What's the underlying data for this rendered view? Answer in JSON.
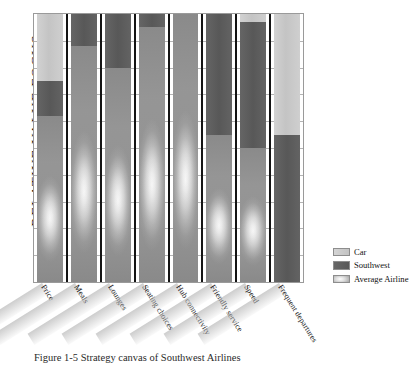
{
  "chart_data": {
    "type": "bar",
    "title": "",
    "subtitle": "",
    "xlabel": "",
    "ylabel": "RELATIVE VALUE FOCUS",
    "ylim": [
      0,
      100
    ],
    "grid": true,
    "gridlines": 10,
    "legend_position": "right",
    "categories": [
      "Price",
      "Meals",
      "Lounges",
      "Seating choices",
      "Hub connectivity",
      "Friendly service",
      "Speed",
      "Frequent departures"
    ],
    "series": [
      {
        "name": "Car",
        "color": "#cacaca",
        "values": [
          100,
          0,
          0,
          0,
          0,
          0,
          100,
          100
        ]
      },
      {
        "name": "Southwest",
        "color": "#5f5f5f",
        "values": [
          75,
          100,
          100,
          100,
          0,
          100,
          97,
          55
        ]
      },
      {
        "name": "Average Airline",
        "color": "#b5b5b5",
        "values": [
          62,
          88,
          80,
          95,
          100,
          55,
          50,
          0
        ]
      }
    ],
    "annotations": []
  },
  "legend": {
    "items": [
      {
        "label": "Car",
        "swatch": "car"
      },
      {
        "label": "Southwest",
        "swatch": "sw"
      },
      {
        "label": "Average Airline",
        "swatch": "avg"
      }
    ]
  },
  "caption": {
    "text": "Figure 1-5  Strategy canvas of Southwest Airlines"
  }
}
